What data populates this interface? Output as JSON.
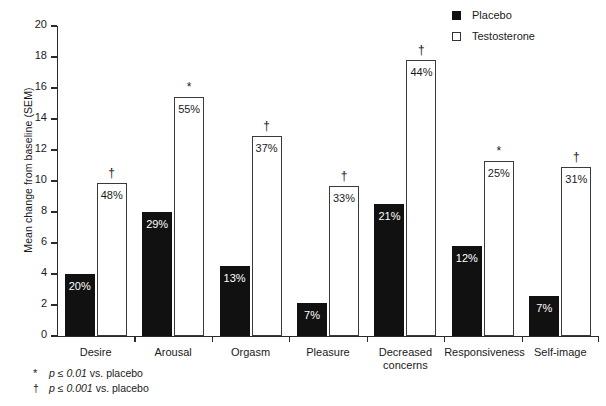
{
  "chart_data": {
    "type": "bar",
    "title": "",
    "xlabel": "",
    "ylabel": "Mean change from baseline (SEM)",
    "ylim": [
      0,
      20
    ],
    "yticks": [
      0,
      2,
      4,
      6,
      8,
      10,
      12,
      14,
      16,
      18,
      20
    ],
    "grid": false,
    "legend_position": "top-right",
    "categories": [
      "Desire",
      "Arousal",
      "Orgasm",
      "Pleasure",
      "Decreased concerns",
      "Responsiveness",
      "Self-image"
    ],
    "series": [
      {
        "name": "Placebo",
        "color": "#111111",
        "style": "filled",
        "values": [
          4.0,
          8.0,
          4.5,
          2.1,
          8.5,
          5.8,
          2.6
        ],
        "data_labels": [
          "20%",
          "29%",
          "13%",
          "7%",
          "21%",
          "12%",
          "7%"
        ],
        "significance": [
          "",
          "",
          "",
          "",
          "",
          "",
          ""
        ]
      },
      {
        "name": "Testosterone",
        "color": "#ffffff",
        "style": "hollow",
        "values": [
          9.9,
          15.4,
          12.9,
          9.7,
          17.8,
          11.3,
          10.9
        ],
        "data_labels": [
          "48%",
          "55%",
          "37%",
          "33%",
          "44%",
          "25%",
          "31%"
        ],
        "significance": [
          "†",
          "*",
          "†",
          "†",
          "†",
          "*",
          "†"
        ]
      }
    ],
    "annotations": [
      "* p ≤ 0.01 vs. placebo",
      "† p ≤ 0.001 vs. placebo"
    ]
  },
  "legend": {
    "items": [
      {
        "label": "Placebo",
        "swatch": "filled-square-icon"
      },
      {
        "label": "Testosterone",
        "swatch": "hollow-square-icon"
      }
    ]
  },
  "footnotes": [
    {
      "symbol": "*",
      "p_operator": "p ≤ 0.01",
      "text": " vs. placebo"
    },
    {
      "symbol": "†",
      "p_operator": "p ≤ 0.001",
      "text": " vs. placebo"
    }
  ]
}
